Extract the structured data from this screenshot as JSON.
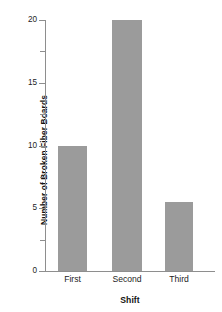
{
  "chart_data": {
    "type": "bar",
    "title": "",
    "subtitle": "",
    "xlabel": "Shift",
    "ylabel": "Number of Broken Fiber Boards",
    "categories": [
      "First",
      "Second",
      "Third"
    ],
    "values": [
      10,
      20,
      5.5
    ],
    "series": [
      {
        "name": "Broken Fiber Boards",
        "values": [
          10,
          20,
          5.5
        ]
      }
    ],
    "ylim": [
      0,
      20
    ],
    "y_major_ticks": [
      0,
      5,
      10,
      15,
      20
    ],
    "y_minor_ticks": [
      2.5,
      7.5,
      12.5,
      17.5
    ],
    "y_tick_labels": [
      "0",
      "5",
      "10",
      "15",
      "20"
    ],
    "grid": false,
    "legend": false,
    "legend_position": "none",
    "bar_color": "#9b9b9b",
    "axis_color": "#8e8e8e",
    "text_color": "#1d1d1d"
  }
}
